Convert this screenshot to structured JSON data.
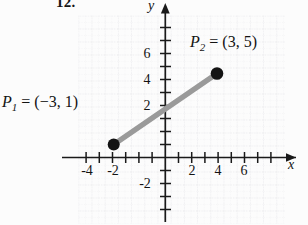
{
  "problem": {
    "number": "12."
  },
  "figure": {
    "axes": {
      "x_label": "x",
      "y_label": "y",
      "x_tick_labels": [
        "-4",
        "-2",
        "2",
        "4",
        "6"
      ],
      "x_tick_values": [
        -4,
        -2,
        2,
        4,
        6
      ],
      "y_tick_labels": [
        "6",
        "4",
        "2",
        "-2"
      ],
      "y_tick_values": [
        6,
        4,
        2,
        -2
      ],
      "xlim": [
        -6.6,
        8.6
      ],
      "ylim": [
        -4.6,
        8.4
      ],
      "grid": "dotted",
      "arrows": [
        "x-positive",
        "y-positive"
      ]
    },
    "points": [
      {
        "name": "P1",
        "label": "P₁ = (−3, 1)",
        "label_p": "P",
        "label_sub": "1",
        "label_rest": " = (−3, 1)",
        "x": -3,
        "y": 1
      },
      {
        "name": "P2",
        "label": "P₂ = (3, 5)",
        "label_p": "P",
        "label_sub": "2",
        "label_rest": " = (3, 5)",
        "x": 3,
        "y": 5
      }
    ],
    "segment": {
      "from": "P1",
      "to": "P2",
      "color": "#9a9a9a"
    },
    "colors": {
      "background": "#fcfcfc",
      "axis": "#1a1a1a",
      "grid_minor": "#e3e3e8",
      "grid_major": "#cfcfd6",
      "point": "#141414",
      "segment": "#9a9a9a",
      "text": "#131313"
    }
  }
}
